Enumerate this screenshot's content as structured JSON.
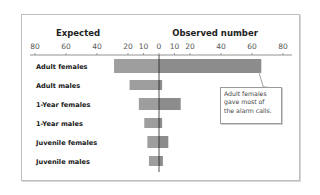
{
  "chart_data": {
    "type": "bar",
    "subtype": "back-to-back horizontal bar",
    "headers": {
      "left": "Expected",
      "right": "Observed number"
    },
    "left_ticks": [
      "80",
      "60",
      "40",
      "20",
      "10",
      "0"
    ],
    "right_ticks": [
      "10",
      "20",
      "40",
      "60",
      "80"
    ],
    "xlim": [
      -80,
      80
    ],
    "categories": [
      "Adult females",
      "Adult males",
      "1-Year females",
      "1-Year males",
      "Juvenile females",
      "Juvenile males"
    ],
    "series": [
      {
        "name": "Expected",
        "values": [
          29,
          19,
          13,
          9.5,
          7.5,
          6.5
        ],
        "color": "#9e9e9e"
      },
      {
        "name": "Observed",
        "values": [
          66,
          2,
          14,
          2,
          6,
          2.5
        ],
        "color": "#8c8c8c"
      }
    ],
    "annotation": {
      "lines": [
        "Adult females",
        "gave most of",
        "the alarm calls."
      ],
      "target": "Adult females"
    },
    "grid": false
  },
  "callout": {
    "line1": "Adult females",
    "line2": "gave most of",
    "line3": "the alarm calls."
  }
}
